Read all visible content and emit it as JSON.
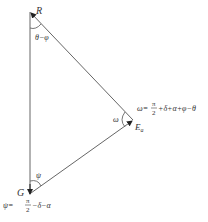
{
  "diagram": {
    "type": "force-triangle",
    "colors": {
      "line": "#555555",
      "text": "#333333",
      "background": "#ffffff"
    },
    "vertices": {
      "R": {
        "label": "R",
        "x": 30,
        "y": 12
      },
      "G": {
        "label": "G",
        "x": 30,
        "y": 194
      },
      "E": {
        "label": "E",
        "subscript": "a",
        "x": 133,
        "y": 120
      }
    },
    "angles": {
      "at_R": {
        "label": "θ−φ"
      },
      "at_E": {
        "label": "ω"
      },
      "at_G": {
        "label": "ψ"
      }
    },
    "formulas": {
      "omega": {
        "lhs": "ω=",
        "frac_num": "π",
        "frac_den": "2",
        "rhs": "+δ+α+φ−θ"
      },
      "psi": {
        "lhs": "ψ=",
        "frac_num": "π",
        "frac_den": "2",
        "rhs": "−δ−α"
      }
    }
  }
}
